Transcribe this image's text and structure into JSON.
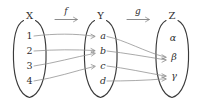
{
  "diagram": {
    "style": {
      "background": "#ffffff",
      "outline_color": "#3a3a3a",
      "arrow_color": "#8e8e8e",
      "text_color": "#2f2f2f"
    },
    "sets": [
      {
        "name": "set-x",
        "label": "X",
        "elements": [
          {
            "name": "element-1",
            "label": "1"
          },
          {
            "name": "element-2",
            "label": "2"
          },
          {
            "name": "element-3",
            "label": "3"
          },
          {
            "name": "element-4",
            "label": "4"
          }
        ]
      },
      {
        "name": "set-y",
        "label": "Y",
        "elements": [
          {
            "name": "element-a",
            "label": "a"
          },
          {
            "name": "element-b",
            "label": "b"
          },
          {
            "name": "element-c",
            "label": "c"
          },
          {
            "name": "element-d",
            "label": "d"
          }
        ]
      },
      {
        "name": "set-z",
        "label": "Z",
        "elements": [
          {
            "name": "element-alpha",
            "label": "α"
          },
          {
            "name": "element-beta",
            "label": "β"
          },
          {
            "name": "element-gamma",
            "label": "γ"
          }
        ]
      }
    ],
    "functions": [
      {
        "name": "function-f",
        "label": "f",
        "domain": "X",
        "codomain": "Y"
      },
      {
        "name": "function-g",
        "label": "g",
        "domain": "Y",
        "codomain": "Z"
      }
    ],
    "mappings": {
      "f": [
        {
          "from": "1",
          "to": "a"
        },
        {
          "from": "2",
          "to": "b"
        },
        {
          "from": "3",
          "to": "b"
        },
        {
          "from": "4",
          "to": "c"
        }
      ],
      "g": [
        {
          "from": "a",
          "to": "β"
        },
        {
          "from": "b",
          "to": "β"
        },
        {
          "from": "c",
          "to": "γ"
        },
        {
          "from": "d",
          "to": "γ"
        }
      ]
    }
  }
}
